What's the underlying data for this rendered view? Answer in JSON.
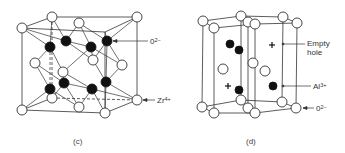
{
  "figures": [
    {
      "id": "c",
      "caption": "(c)",
      "description": "Fluorite-type ZrO2 crystal structure unit cell",
      "labels": [
        {
          "text": "0",
          "sup": "2−",
          "points_to": "black atom (oxygen)"
        },
        {
          "text": "Zr",
          "sup": "4+",
          "points_to": "white atom (zirconium)"
        }
      ],
      "cube": {
        "back": [
          [
            52,
            17
          ],
          [
            137,
            17
          ],
          [
            137,
            100
          ],
          [
            52,
            98
          ]
        ],
        "front": [
          [
            22,
            28
          ],
          [
            105,
            32
          ],
          [
            105,
            113
          ],
          [
            22,
            110
          ]
        ]
      },
      "white_atoms": [
        [
          52,
          17
        ],
        [
          137,
          17
        ],
        [
          22,
          28
        ],
        [
          79,
          23
        ],
        [
          35,
          63
        ],
        [
          63,
          72
        ],
        [
          93,
          60
        ],
        [
          122,
          65
        ],
        [
          52,
          98
        ],
        [
          137,
          100
        ],
        [
          79,
          107
        ],
        [
          22,
          110
        ],
        [
          105,
          113
        ]
      ],
      "black_atoms": [
        [
          50,
          47
        ],
        [
          66,
          41
        ],
        [
          91,
          47
        ],
        [
          107,
          41
        ],
        [
          50,
          89
        ],
        [
          64,
          83
        ],
        [
          92,
          89
        ],
        [
          106,
          82
        ]
      ]
    },
    {
      "id": "d",
      "caption": "(d)",
      "description": "Corundum Al2O3 hexagonal structure",
      "labels": [
        {
          "text": "Empty",
          "line2": "hole",
          "points_to": "plus marker (empty interstitial)"
        },
        {
          "text": "Al",
          "sup": "3+",
          "points_to": "black atom (aluminum)"
        },
        {
          "text": "0",
          "sup": "2−",
          "points_to": "white atom (oxygen)"
        }
      ],
      "top_atoms": [
        [
          203,
          21
        ],
        [
          214,
          28
        ],
        [
          241,
          16
        ],
        [
          248,
          22
        ],
        [
          255,
          24
        ],
        [
          283,
          17
        ],
        [
          297,
          23
        ]
      ],
      "bottom_atoms": [
        [
          202,
          107
        ],
        [
          214,
          113
        ],
        [
          241,
          100
        ],
        [
          248,
          108
        ],
        [
          255,
          113
        ],
        [
          282,
          102
        ],
        [
          296,
          108
        ]
      ],
      "interior_white_atoms": [
        [
          223,
          69
        ],
        [
          253,
          63
        ],
        [
          265,
          71
        ]
      ],
      "black_atoms": [
        [
          230,
          44
        ],
        [
          239,
          50
        ],
        [
          239,
          90
        ],
        [
          273,
          86
        ]
      ],
      "empty_holes": [
        [
          272,
          45
        ],
        [
          228,
          86
        ]
      ]
    }
  ],
  "colors": {
    "line": "#333333",
    "atom_white": "#ffffff",
    "atom_black": "#111111",
    "text": "#333333"
  }
}
